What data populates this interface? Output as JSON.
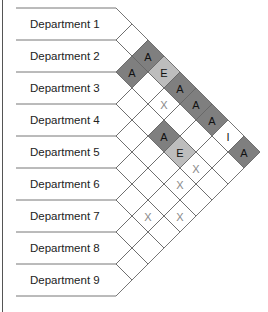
{
  "departments": [
    "Department 1",
    "Department 2",
    "Department 3",
    "Department 4",
    "Department 5",
    "Department 6",
    "Department 7",
    "Department 8",
    "Department 9"
  ],
  "colors": {
    "A": "#7f7f7f",
    "E": "#bdbdbd",
    "I": "#ffffff",
    "X": "#ffffff",
    "empty": "#ffffff",
    "line": "#666666",
    "text_dark": "#111111",
    "text_x": "#888888"
  },
  "relationships": [
    {
      "from": 1,
      "to": 3,
      "code": "A"
    },
    {
      "from": 2,
      "to": 3,
      "code": "A"
    },
    {
      "from": 1,
      "to": 4,
      "code": "E"
    },
    {
      "from": 1,
      "to": 5,
      "code": "A"
    },
    {
      "from": 2,
      "to": 5,
      "code": "X"
    },
    {
      "from": 1,
      "to": 6,
      "code": "A"
    },
    {
      "from": 1,
      "to": 7,
      "code": "A"
    },
    {
      "from": 3,
      "to": 6,
      "code": "A"
    },
    {
      "from": 1,
      "to": 8,
      "code": "I"
    },
    {
      "from": 3,
      "to": 7,
      "code": "E"
    },
    {
      "from": 1,
      "to": 9,
      "code": "A"
    },
    {
      "from": 3,
      "to": 8,
      "code": "X"
    },
    {
      "from": 4,
      "to": 8,
      "code": "X"
    },
    {
      "from": 6,
      "to": 8,
      "code": "X"
    },
    {
      "from": 5,
      "to": 9,
      "code": "X"
    }
  ]
}
